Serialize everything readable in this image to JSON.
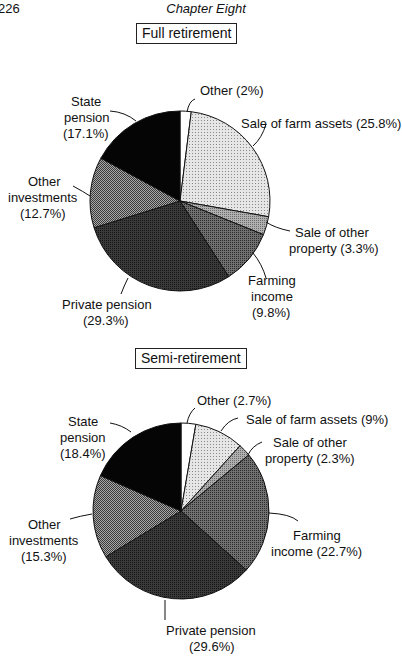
{
  "page": {
    "number": "226",
    "running_header": "Chapter Eight"
  },
  "chart_data": [
    {
      "type": "pie",
      "title": "Full retirement",
      "categories": [
        "Other",
        "Sale of farm assets",
        "Sale of other property",
        "Farming income",
        "Private pension",
        "Other investments",
        "State pension"
      ],
      "values": [
        2.0,
        25.8,
        3.3,
        9.8,
        29.3,
        12.7,
        17.1
      ],
      "unit": "%",
      "labels": [
        "Other (2%)",
        "Sale of farm assets (25.8%)",
        "Sale of other property (3.3%)",
        "Farming income (9.8%)",
        "Private pension (29.3%)",
        "Other investments (12.7%)",
        "State pension (17.1%)"
      ],
      "start_angle": "12 o'clock, clockwise"
    },
    {
      "type": "pie",
      "title": "Semi-retirement",
      "categories": [
        "Other",
        "Sale of farm assets",
        "Sale of other property",
        "Farming income",
        "Private pension",
        "Other investments",
        "State pension"
      ],
      "values": [
        2.7,
        9.0,
        2.3,
        22.7,
        29.6,
        15.3,
        18.4
      ],
      "unit": "%",
      "labels": [
        "Other (2.7%)",
        "Sale of farm assets (9%)",
        "Sale of other property (2.3%)",
        "Farming income (22.7%)",
        "Private pension (29.6%)",
        "Other investments (15.3%)",
        "State pension (18.4%)"
      ],
      "start_angle": "12 o'clock, clockwise"
    }
  ],
  "fills": {
    "Other": "#ffffff",
    "Sale of farm assets": "#d4d4d4",
    "Sale of other property": "#9a9a9a",
    "Farming income": "#5e5e5e",
    "Private pension": "#2c2c2c",
    "Other investments": "#8a8a8a",
    "State pension": "#060606"
  },
  "labels_full": {
    "other": [
      "Other (2%)"
    ],
    "farm_assets": [
      "Sale of farm assets (25.8%)"
    ],
    "other_property": [
      "Sale of other",
      "property (3.3%)"
    ],
    "farming_income": [
      "Farming",
      "income",
      "(9.8%)"
    ],
    "private_pension": [
      "Private pension",
      "(29.3%)"
    ],
    "other_investments": [
      "Other",
      "investments",
      "(12.7%)"
    ],
    "state_pension": [
      "State",
      "pension",
      "(17.1%)"
    ]
  },
  "labels_semi": {
    "other": [
      "Other (2.7%)"
    ],
    "farm_assets": [
      "Sale of farm assets (9%)"
    ],
    "other_property": [
      "Sale of other",
      "property (2.3%)"
    ],
    "farming_income": [
      "Farming",
      "income (22.7%)"
    ],
    "private_pension": [
      "Private pension",
      "(29.6%)"
    ],
    "other_investments": [
      "Other",
      "investments",
      "(15.3%)"
    ],
    "state_pension": [
      "State",
      "pension",
      "(18.4%)"
    ]
  }
}
